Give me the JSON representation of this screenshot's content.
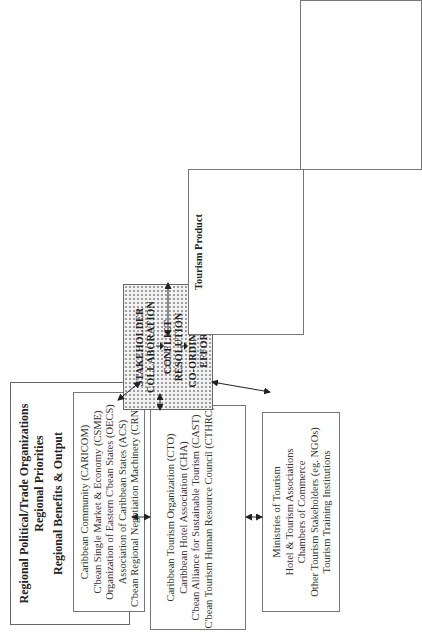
{
  "regional_box": {
    "title_line1": "Regional Political/Trade Organizations",
    "title_line2": "Regional Priorities",
    "title_line3": "Regional Benefits & Output",
    "items": [
      "Caribbean Community (CARICOM)",
      "C'bean Single Market & Economy (CSME)",
      "Organization of Eastern C'bean States (OECS)",
      "Association of Caribbean States (ACS)",
      "C'bean Regional Negotiation Machinery (CRNM)"
    ]
  },
  "tourism_org_box": {
    "items": [
      "Caribbean Tourism Organization (CTO)",
      "Caribbean Hotel Association (CHA)",
      "C'bean Alliance for Sustainable Tourism  (CAST)",
      "C'bean Tourism Human Resource Council (CTHRC)"
    ]
  },
  "national_box": {
    "items": [
      "Ministries of Tourism",
      "Hotel & Tourism Associations",
      "Chambers of Commerce",
      "Other Tourism Stakeholders (eg. NGOs)",
      "Tourism Training Institutions"
    ]
  },
  "stakeholder_box": {
    "step1_line1": "STAKEHOLDER",
    "step1_line2": "COLLABORATION",
    "step2_line1": "CONFLICT",
    "step2_line2": "RESOLUTION",
    "step3_line1": "CO-ORDINATED",
    "step3_line2": "EFFORT"
  },
  "tourism_areas_box": {
    "sections": [
      {
        "title": "Tourism Product",
        "items": [
          "Standards",
          "Service Quality",
          "Community Tourism",
          "New niche markets",
          "Impact Analysis &",
          "Management"
        ]
      },
      {
        "title": "Research & Innovation",
        "items": [
          "Market intelligence",
          "Technological innovation",
          "E-commerce",
          "Information Clearing House",
          "HR Training"
        ]
      },
      {
        "title": "Marketing & Promotion",
        "items": [
          "Caribbean brand",
          "Caribbean Tour packages",
          "E-marketing",
          "Emerging Markets"
        ]
      },
      {
        "title": "Health & Safety",
        "items": [
          "HIV/AIDS awareness",
          "Visitor Safety & Security",
          "Disaster preparedness",
          "Risk Management"
        ]
      },
      {
        "title": "Tourism Support Services",
        "items": [
          "Regional transportation",
          "Investment & Taxation"
        ]
      }
    ]
  },
  "sustainable_box": {
    "title": "Sustainable Tourism:",
    "bullets": [
      {
        "text": "Cohesive tourism",
        "cont": "industry"
      },
      {
        "text": "Sustainable tourism",
        "cont": ""
      },
      {
        "text": "Globally competitive",
        "cont": "tourism industry"
      },
      {
        "text": "Economies of scale",
        "cont": ""
      },
      {
        "text": "Mobilization of",
        "cont": "resources"
      },
      {
        "text": "Capacity-building",
        "cont": ""
      },
      {
        "text": "Increase Value-added",
        "cont": ""
      },
      {
        "text": "Co-ordinated tourism",
        "cont": "development planning"
      },
      {
        "text": "Diversified Tourism",
        "cont": "Product"
      },
      {
        "text": "Identification of",
        "cont": "Industry Best Practices"
      }
    ]
  }
}
